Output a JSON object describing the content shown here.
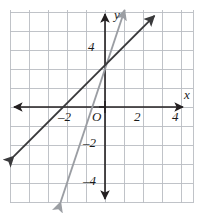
{
  "figure": {
    "type": "coordinate-plane"
  },
  "axes": {
    "x_axis_label": "x",
    "y_axis_label": "y",
    "origin_label": "O",
    "x_ticks": [
      {
        "value": -2,
        "label": "–2"
      },
      {
        "value": 2,
        "label": "2"
      },
      {
        "value": 4,
        "label": "4"
      }
    ],
    "y_ticks": [
      {
        "value": 4,
        "label": "4"
      },
      {
        "value": -2,
        "label": "–2"
      },
      {
        "value": -4,
        "label": "–4"
      }
    ],
    "xlim": [
      -5,
      4.6
    ],
    "ylim": [
      -5,
      5.2
    ],
    "grid": true,
    "grid_color": "#b9bcc2",
    "axis_color": "#231f20"
  },
  "chart_data": {
    "type": "line",
    "title": "",
    "xlabel": "x",
    "ylabel": "y",
    "xlim": [
      -5,
      4.6
    ],
    "ylim": [
      -5,
      5.2
    ],
    "grid": true,
    "legend": "none",
    "series": [
      {
        "name": "line-dark",
        "color": "#3a3a3c",
        "slope": 1,
        "intercept": 2.2,
        "points": [
          [
            -4.8,
            -2.6
          ],
          [
            2.6,
            4.8
          ]
        ],
        "arrows": "both"
      },
      {
        "name": "line-gray",
        "color": "#9b9ea3",
        "slope": 3,
        "intercept": 2,
        "points": [
          [
            -3.2,
            -7.6
          ],
          [
            1.85,
            7.55
          ]
        ],
        "arrows": "both"
      }
    ],
    "intersection": [
      0.95,
      3.15
    ]
  },
  "colors": {
    "grid": "#b9bcc2",
    "axis": "#231f20",
    "line_dark": "#3a3a3c",
    "line_gray": "#9b9ea3",
    "background": "#ffffff"
  }
}
